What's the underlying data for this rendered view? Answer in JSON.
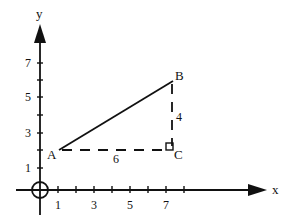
{
  "axes": {
    "x_label": "x",
    "y_label": "y",
    "x_ticks": [
      {
        "value": 1,
        "label": "1"
      },
      {
        "value": 2,
        "label": ""
      },
      {
        "value": 3,
        "label": "3"
      },
      {
        "value": 4,
        "label": ""
      },
      {
        "value": 5,
        "label": "5"
      },
      {
        "value": 6,
        "label": ""
      },
      {
        "value": 7,
        "label": "7"
      },
      {
        "value": 8,
        "label": ""
      }
    ],
    "y_ticks": [
      {
        "value": 1,
        "label": "1"
      },
      {
        "value": 2,
        "label": ""
      },
      {
        "value": 3,
        "label": "3"
      },
      {
        "value": 4,
        "label": ""
      },
      {
        "value": 5,
        "label": "5"
      },
      {
        "value": 6,
        "label": ""
      },
      {
        "value": 7,
        "label": "7"
      }
    ]
  },
  "points": {
    "A": {
      "label": "A",
      "x": 1,
      "y": 2
    },
    "B": {
      "label": "B",
      "x": 7,
      "y": 6
    },
    "C": {
      "label": "C",
      "x": 7,
      "y": 2
    }
  },
  "segments": {
    "AB": {
      "style": "solid"
    },
    "AC": {
      "style": "dashed",
      "length_label": "6"
    },
    "BC": {
      "style": "dashed",
      "length_label": "4"
    }
  },
  "colors": {
    "ink": "#111111",
    "background": "#ffffff"
  }
}
